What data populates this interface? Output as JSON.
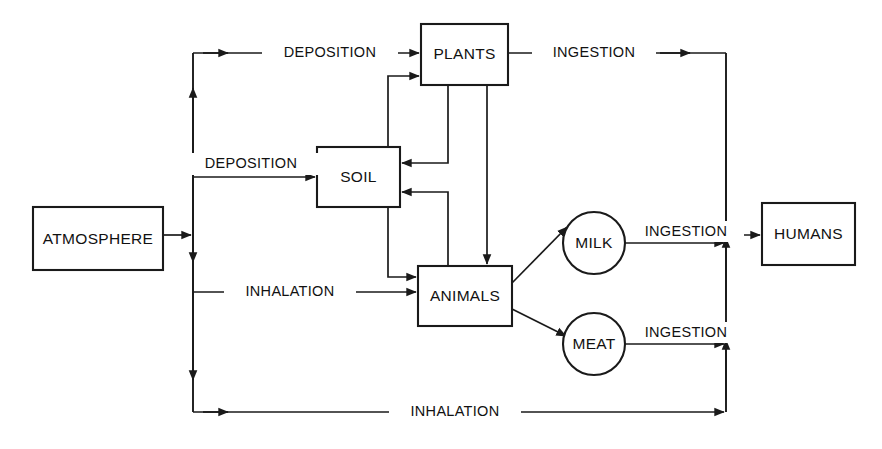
{
  "diagram": {
    "type": "flow-diagram",
    "background_color": "#ffffff",
    "line_color": "#1a1a1a",
    "nodes": [
      {
        "id": "atmosphere",
        "label": "ATMOSPHERE",
        "shape": "rect",
        "x": 33,
        "y": 207,
        "w": 130,
        "h": 63
      },
      {
        "id": "soil",
        "label": "SOIL",
        "shape": "rect",
        "x": 317,
        "y": 147,
        "w": 83,
        "h": 60
      },
      {
        "id": "plants",
        "label": "PLANTS",
        "shape": "rect",
        "x": 421,
        "y": 24,
        "w": 87,
        "h": 61
      },
      {
        "id": "animals",
        "label": "ANIMALS",
        "shape": "rect",
        "x": 418,
        "y": 266,
        "w": 94,
        "h": 60
      },
      {
        "id": "milk",
        "label": "MILK",
        "shape": "circle",
        "cx": 594,
        "cy": 243,
        "r": 31
      },
      {
        "id": "meat",
        "label": "MEAT",
        "shape": "circle",
        "cx": 594,
        "cy": 344,
        "r": 31
      },
      {
        "id": "humans",
        "label": "HUMANS",
        "shape": "rect",
        "x": 762,
        "y": 203,
        "w": 93,
        "h": 62
      }
    ],
    "edge_labels": [
      {
        "id": "deposition-plants",
        "text": "DEPOSITION",
        "x": 330,
        "y": 53
      },
      {
        "id": "deposition-soil",
        "text": "DEPOSITION",
        "x": 248,
        "y": 164
      },
      {
        "id": "inhalation-animals",
        "text": "INHALATION",
        "x": 290,
        "y": 292
      },
      {
        "id": "inhalation-humans",
        "text": "INHALATION",
        "x": 455,
        "y": 412
      },
      {
        "id": "ingestion-plants-humans",
        "text": "INGESTION",
        "x": 594,
        "y": 53
      },
      {
        "id": "ingestion-milk-humans",
        "text": "INGESTION",
        "x": 684,
        "y": 232
      },
      {
        "id": "ingestion-meat-humans",
        "text": "INGESTION",
        "x": 684,
        "y": 333
      }
    ],
    "pathways": [
      {
        "from": "atmosphere",
        "to": "plants",
        "via": "deposition"
      },
      {
        "from": "atmosphere",
        "to": "soil",
        "via": "deposition"
      },
      {
        "from": "atmosphere",
        "to": "animals",
        "via": "inhalation"
      },
      {
        "from": "atmosphere",
        "to": "humans",
        "via": "inhalation"
      },
      {
        "from": "soil",
        "to": "plants",
        "via": "uptake"
      },
      {
        "from": "plants",
        "to": "soil",
        "via": "return"
      },
      {
        "from": "animals",
        "to": "soil",
        "via": "return"
      },
      {
        "from": "soil",
        "to": "animals",
        "via": "uptake"
      },
      {
        "from": "plants",
        "to": "animals",
        "via": "ingestion"
      },
      {
        "from": "plants",
        "to": "humans",
        "via": "ingestion"
      },
      {
        "from": "animals",
        "to": "milk",
        "via": "production"
      },
      {
        "from": "animals",
        "to": "meat",
        "via": "production"
      },
      {
        "from": "milk",
        "to": "humans",
        "via": "ingestion"
      },
      {
        "from": "meat",
        "to": "humans",
        "via": "ingestion"
      }
    ]
  }
}
